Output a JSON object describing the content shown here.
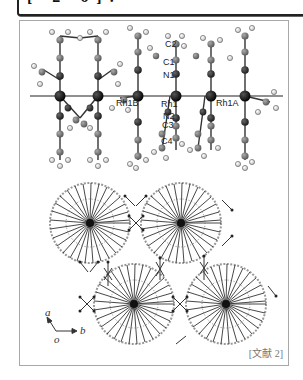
{
  "header": {
    "title_fragment": "[ 2 6]."
  },
  "figure": {
    "upper_panel": {
      "description": "1D Rh chain crystal structure (side view)",
      "chain_axis_y": 96,
      "atom_labels": [
        {
          "id": "C2",
          "text": "C2",
          "x": 165,
          "y": 40
        },
        {
          "id": "C1",
          "text": "C1",
          "x": 163,
          "y": 58
        },
        {
          "id": "N1",
          "text": "N1",
          "x": 163,
          "y": 71
        },
        {
          "id": "Rh1B",
          "text": "Rh1B",
          "x": 116,
          "y": 99
        },
        {
          "id": "Rh1",
          "text": "Rh1",
          "x": 161,
          "y": 100
        },
        {
          "id": "Rh1A",
          "text": "Rh1A",
          "x": 216,
          "y": 99
        },
        {
          "id": "N2",
          "text": "N2",
          "x": 163,
          "y": 112
        },
        {
          "id": "C3",
          "text": "C3",
          "x": 162,
          "y": 121
        },
        {
          "id": "C4",
          "text": "C4",
          "x": 161,
          "y": 137
        }
      ]
    },
    "lower_panel": {
      "description": "Crystal packing viewed along c-axis",
      "axes": {
        "a_label": "a",
        "b_label": "b",
        "origin_label": "o"
      }
    },
    "citation": "[文献 2]"
  },
  "colors": {
    "rh_atom": "#111111",
    "n_atom": "#2a2a2a",
    "c_atom": "#6e6e6e",
    "h_atom": "#ffffff",
    "bond": "#333333",
    "panel_border": "#a8a8a8"
  }
}
